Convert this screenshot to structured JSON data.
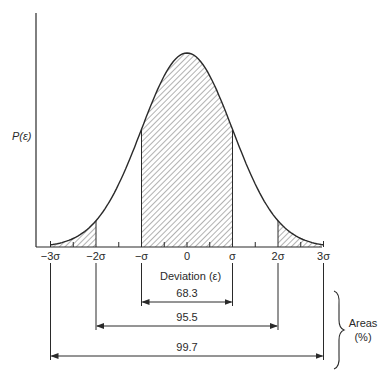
{
  "diagram": {
    "y_axis_label": "P(ε)",
    "x_axis_label": "Deviation (ε)",
    "tick_labels": [
      "−3σ",
      "−2σ",
      "−σ",
      "0",
      "σ",
      "2σ",
      "3σ"
    ],
    "tick_values_sigma": [
      -3,
      -2,
      -1,
      0,
      1,
      2,
      3
    ],
    "shaded_regions_sigma": [
      [
        -3,
        -2
      ],
      [
        -1,
        1
      ],
      [
        2,
        3
      ]
    ],
    "areas": [
      {
        "label": "68.3",
        "from_sigma": -1,
        "to_sigma": 1
      },
      {
        "label": "95.5",
        "from_sigma": -2,
        "to_sigma": 2
      },
      {
        "label": "99.7",
        "from_sigma": -3,
        "to_sigma": 3
      }
    ],
    "areas_label_line1": "Areas",
    "areas_label_line2": "(%)",
    "line_color": "#2a2a2a",
    "hatch_color": "#555555"
  }
}
